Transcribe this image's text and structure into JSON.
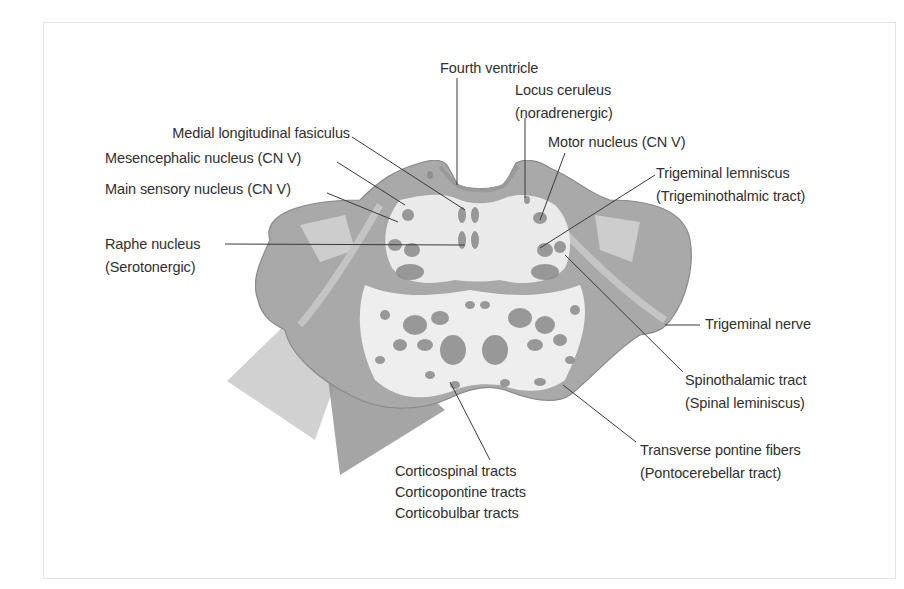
{
  "figure": {
    "colors": {
      "background": "#ffffff",
      "frame": "#e4e4e4",
      "tissue_outer": "#a9a9a9",
      "tissue_inner": "#ececec",
      "nuclei": "#8a8a8a",
      "leader_line": "#3a3a3a",
      "label_text": "#2f2f2f"
    }
  },
  "labels": {
    "fourth_ventricle": [
      "Fourth ventricle"
    ],
    "locus_ceruleus": [
      "Locus ceruleus",
      "(noradrenergic)"
    ],
    "medial_longitudinal_fasciculus": [
      "Medial longitudinal fasiculus"
    ],
    "mesencephalic_nucleus": [
      "Mesencephalic nucleus (CN V)"
    ],
    "main_sensory_nucleus": [
      "Main sensory nucleus (CN V)"
    ],
    "motor_nucleus": [
      "Motor nucleus (CN V)"
    ],
    "trigeminal_lemniscus": [
      "Trigeminal lemniscus",
      "(Trigeminothalmic tract)"
    ],
    "raphe_nucleus": [
      "Raphe nucleus",
      "(Serotonergic)"
    ],
    "trigeminal_nerve": [
      "Trigeminal nerve"
    ],
    "spinothalamic_tract": [
      "Spinothalamic tract",
      "(Spinal leminiscus)"
    ],
    "transverse_pontine_fibers": [
      "Transverse pontine fibers",
      "(Pontocerebellar tract)"
    ],
    "corticospinal_group": [
      "Corticospinal tracts",
      "Corticopontine tracts",
      "Corticobulbar tracts"
    ]
  }
}
